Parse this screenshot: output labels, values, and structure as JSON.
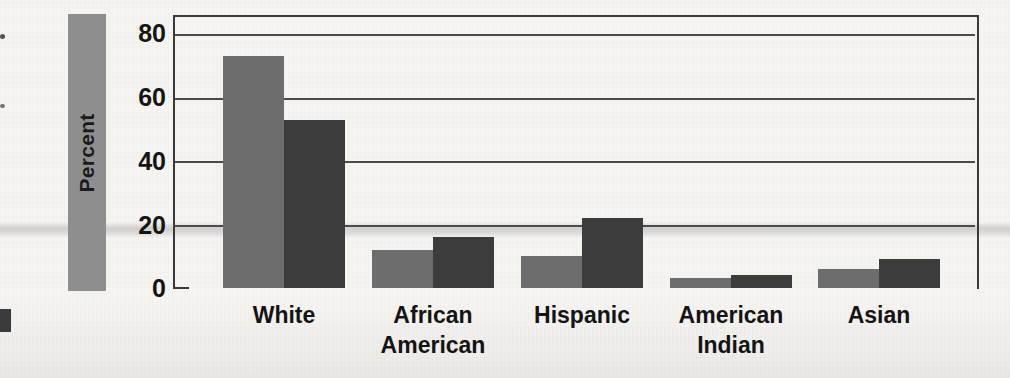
{
  "figure": {
    "background_color": "#f6f4f1",
    "axis_color": "#3a3a3a"
  },
  "axis": {
    "y_title": "Percent",
    "y_ticks": [
      "80",
      "60",
      "40",
      "20",
      "0"
    ]
  },
  "chart_data": {
    "type": "bar",
    "title": "",
    "xlabel": "",
    "ylabel": "Percent",
    "ylim": [
      0,
      80
    ],
    "yticks": [
      0,
      20,
      40,
      60,
      80
    ],
    "grid": true,
    "legend": "none",
    "categories": [
      "White",
      "African\nAmerican",
      "Hispanic",
      "American\nIndian",
      "Asian"
    ],
    "series": [
      {
        "name": "series-a",
        "color": "#6d6d6d",
        "values": [
          73,
          12,
          10,
          3,
          6
        ]
      },
      {
        "name": "series-b",
        "color": "#3c3c3c",
        "values": [
          53,
          16,
          22,
          4,
          9
        ]
      }
    ]
  }
}
